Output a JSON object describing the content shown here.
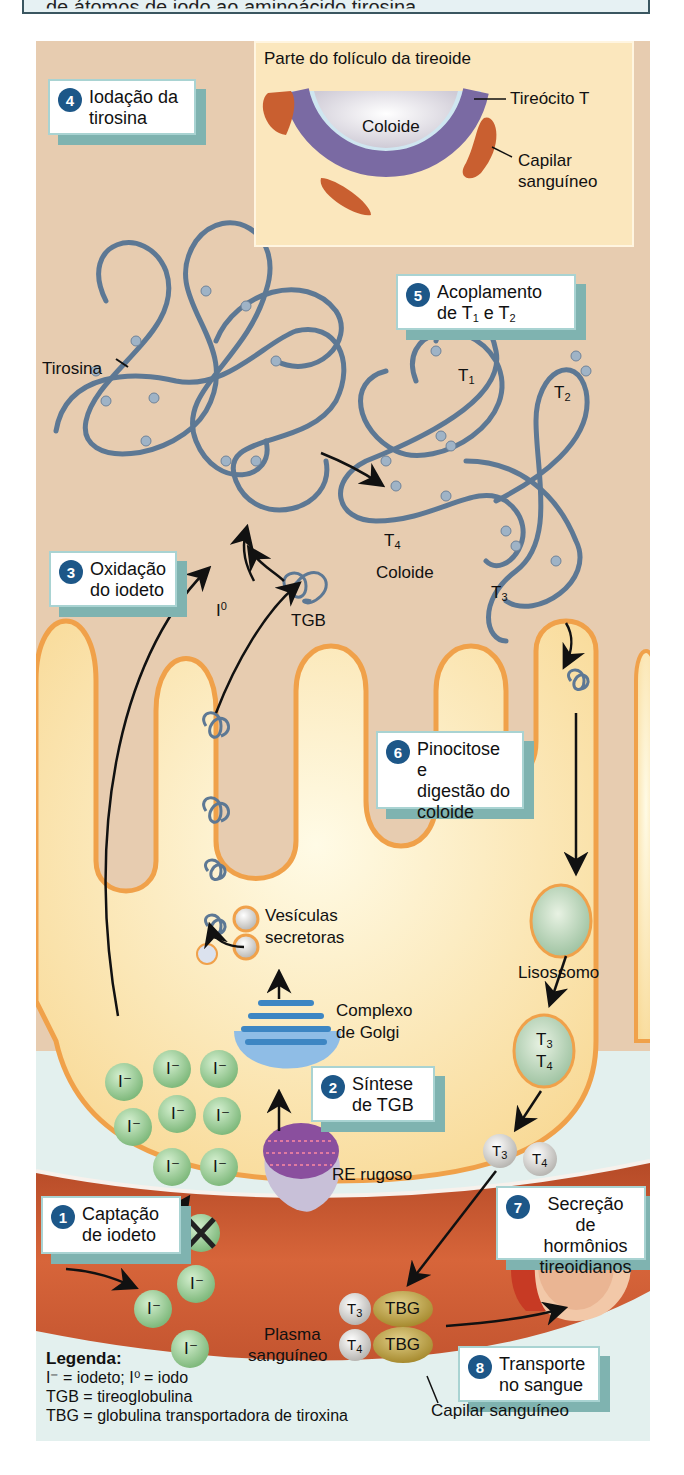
{
  "header": {
    "caption_fragment": "de átomos de iodo ao aminoácido tirosina."
  },
  "inset": {
    "title": "Parte do folículo da tireoide",
    "center_label": "Coloide",
    "label_cell": "Tireócito T",
    "label_capillary_line1": "Capilar",
    "label_capillary_line2": "sanguíneo"
  },
  "steps": [
    {
      "num": "1",
      "text": "Captação\nde iodeto"
    },
    {
      "num": "2",
      "text": "Síntese\nde TGB"
    },
    {
      "num": "3",
      "text": "Oxidação\ndo iodeto"
    },
    {
      "num": "4",
      "text": "Iodação da\ntirosina"
    },
    {
      "num": "5",
      "text_main": "Acoplamento",
      "text_pre": "de T",
      "sub1": "1",
      "mid": " e T",
      "sub2": "2"
    },
    {
      "num": "6",
      "text": "Pinocitose e\ndigestão do\ncoloide"
    },
    {
      "num": "7",
      "text": "Secreção\nde hormônios\ntireoidianos"
    },
    {
      "num": "8",
      "text": "Transporte\nno sangue"
    }
  ],
  "labels": {
    "tirosina": "Tirosina",
    "coloide": "Coloide",
    "tgb": "TGB",
    "i0": "I",
    "i0_sup": "0",
    "t1": "T",
    "t1_sub": "1",
    "t2": "T",
    "t2_sub": "2",
    "t3": "T",
    "t3_sub": "3",
    "t4": "T",
    "t4_sub": "4",
    "vesiculas_line1": "Vesículas",
    "vesiculas_line2": "secretoras",
    "golgi_line1": "Complexo",
    "golgi_line2": "de Golgi",
    "re": "RE rugoso",
    "lisossomo": "Lisossomo",
    "plasma_line1": "Plasma",
    "plasma_line2": "sanguíneo",
    "capilar": "Capilar sanguíneo",
    "iodide_ion": "I⁻",
    "tbg": "TBG"
  },
  "legend": {
    "title": "Legenda:",
    "line1": "I⁻ = iodeto; I⁰ = iodo",
    "line2": "TGB = tireoglobulina",
    "line3": "TBG = globulina transportadora de tiroxina"
  },
  "colors": {
    "colloid_bg": "#e7ccb0",
    "cell_fill": "#fbe2a6",
    "cell_border": "#f0a14a",
    "blood_vessel": "#c9552e",
    "step_badge": "#1d5788",
    "step_shadow": "#7fb3b0",
    "iodide_green": "#8cc38a",
    "tbg_olive": "#b59b3e",
    "protein_strand": "#5d7894"
  }
}
